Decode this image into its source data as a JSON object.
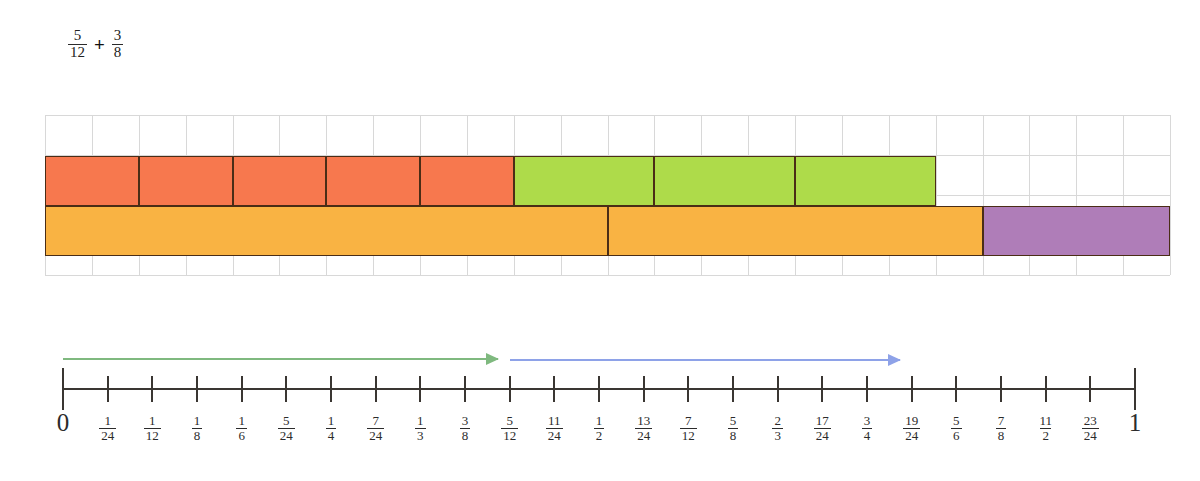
{
  "expression": {
    "left": {
      "numerator": "5",
      "denominator": "12"
    },
    "operator": "+",
    "right": {
      "numerator": "3",
      "denominator": "8"
    }
  },
  "colors": {
    "coral": "#F7784E",
    "green": "#AEDB4A",
    "amber": "#F9B343",
    "purple": "#AF7DB8",
    "outline": "#4A2D16",
    "grid": "#D8D8D8",
    "arrow_green": "#7FB97F",
    "arrow_blue": "#8EA2E8",
    "axis": "#3A3632"
  },
  "bar_model": {
    "grid": {
      "columns": 24,
      "rows": 4,
      "visible": true
    },
    "top_row": {
      "label": "addends",
      "segments": [
        {
          "name": "first-addend",
          "color_key": "coral",
          "fraction": "5/12",
          "cells": 5,
          "cell_fraction": "1/12",
          "start_units": 0,
          "width_units": 10
        },
        {
          "name": "second-addend",
          "color_key": "green",
          "fraction": "3/8",
          "cells": 3,
          "cell_fraction": "1/8",
          "start_units": 10,
          "width_units": 9
        }
      ]
    },
    "bottom_row": {
      "label": "whole",
      "segments": [
        {
          "name": "first-half",
          "color_key": "amber",
          "fraction": "1/2",
          "start_units": 0,
          "width_units": 12
        },
        {
          "name": "second-part",
          "color_key": "amber",
          "fraction": "5/24",
          "start_units": 12,
          "width_units": 8
        },
        {
          "name": "remainder",
          "color_key": "purple",
          "fraction": "1/6",
          "start_units": 20,
          "width_units": 4
        }
      ]
    }
  },
  "number_line": {
    "start_value": "0",
    "end_value": "1",
    "divisions": 24,
    "labels": [
      "0",
      "1/24",
      "1/12",
      "1/8",
      "1/6",
      "5/24",
      "1/4",
      "7/24",
      "1/3",
      "3/8",
      "5/12",
      "11/24",
      "1/2",
      "13/24",
      "7/12",
      "5/8",
      "2/3",
      "17/24",
      "3/4",
      "19/24",
      "5/6",
      "7/8",
      "11/2",
      "23/24",
      "1"
    ],
    "arrows": [
      {
        "name": "arrow-green",
        "color_key": "arrow_green",
        "from_units": 0,
        "to_units": 10,
        "represents": "5/12"
      },
      {
        "name": "arrow-blue",
        "color_key": "arrow_blue",
        "from_units": 10,
        "to_units": 19,
        "represents": "3/8"
      }
    ]
  }
}
